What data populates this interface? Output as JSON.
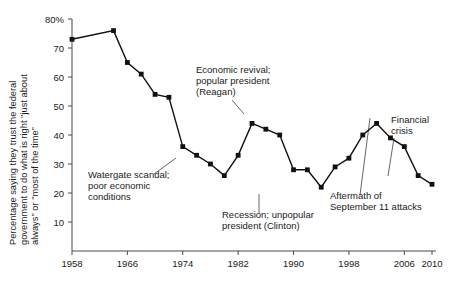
{
  "chart_data": {
    "type": "line",
    "title": "",
    "subtitle": "",
    "xlabel": "",
    "ylabel": "Percentage saying they trust the federal government to do what is right \"just about always\" or \"most of the time\"",
    "ylabel_lines": [
      "Percentage saying they trust the federal",
      "government to do what is right \"just about",
      "always\" or \"most of the time\""
    ],
    "xlim": [
      1958,
      2010
    ],
    "ylim": [
      0,
      80
    ],
    "grid": false,
    "legend": null,
    "y_ticks": [
      10,
      20,
      30,
      40,
      50,
      60,
      70,
      80
    ],
    "y_tick_labels": [
      "10",
      "20",
      "30",
      "40",
      "50",
      "60",
      "70",
      "80%"
    ],
    "x_ticks": [
      1958,
      1966,
      1974,
      1982,
      1990,
      1998,
      2006,
      2010
    ],
    "x_tick_labels": [
      "1958",
      "1966",
      "1974",
      "1982",
      "1990",
      "1998",
      "2006",
      "2010"
    ],
    "series": [
      {
        "name": "Trust in federal government",
        "marker": "square",
        "color": "#111111",
        "x": [
          1958,
          1964,
          1966,
          1968,
          1970,
          1972,
          1974,
          1976,
          1978,
          1980,
          1982,
          1984,
          1986,
          1988,
          1990,
          1992,
          1994,
          1996,
          1998,
          2000,
          2002,
          2004,
          2006,
          2008,
          2010
        ],
        "y": [
          73,
          76,
          65,
          61,
          54,
          53,
          36,
          33,
          30,
          26,
          33,
          44,
          42,
          40,
          28,
          28,
          22,
          29,
          32,
          40,
          44,
          39,
          36,
          26,
          23
        ]
      }
    ],
    "annotations": [
      {
        "id": "watergate",
        "lines": [
          "Watergate scandal;",
          "poor economic",
          "conditions"
        ],
        "text": "Watergate scandal; poor economic conditions",
        "points_to_year": 1976
      },
      {
        "id": "reagan",
        "lines": [
          "Economic revival;",
          "popular president",
          "(Reagan)"
        ],
        "text": "Economic revival; popular president (Reagan)",
        "points_to_year": 1984
      },
      {
        "id": "clinton",
        "lines": [
          "Recession; unpopular",
          "president (Clinton)"
        ],
        "text": "Recession; unpopular president (Clinton)",
        "points_to_year": 1994
      },
      {
        "id": "september11",
        "lines": [
          "Aftermath of",
          "September 11 attacks"
        ],
        "text": "Aftermath of September 11 attacks",
        "points_to_year": 2002
      },
      {
        "id": "financial-crisis",
        "lines": [
          "Financial",
          "crisis"
        ],
        "text": "Financial crisis",
        "points_to_year": 2008
      }
    ]
  }
}
